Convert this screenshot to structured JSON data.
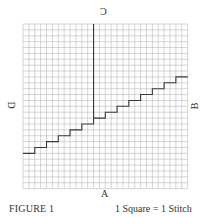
{
  "figure": {
    "caption": "FIGURE 1",
    "scale_note": "1 Square = 1 Stitch",
    "edge_labels": {
      "top": "C",
      "right": "B",
      "bottom": "A",
      "left": "D"
    }
  },
  "grid": {
    "columns": 28,
    "rows": 28,
    "origin_px": [
      23,
      24
    ],
    "cell_px": 5.88,
    "grid_line_color": "#b8b8b8",
    "path_color": "#3a3a3a"
  },
  "chart_data": {
    "type": "diagram",
    "title": "FIGURE 1",
    "subtitle": "1 Square = 1 Stitch",
    "grid_size": [
      28,
      28
    ],
    "edge_labels": {
      "top": "C",
      "right": "B",
      "bottom": "A",
      "left": "D"
    },
    "vertical_line": {
      "column": 12,
      "from_row": 0,
      "to_row": 16
    },
    "staircase": {
      "description": "Step line rising 1 row every 2 columns from left edge (row 22) to right edge (row 9)",
      "start": {
        "column": 0,
        "row": 22
      },
      "end": {
        "column": 28,
        "row": 9
      },
      "step_width_cols": 2,
      "step_height_rows": 1,
      "segments": [
        {
          "cols": [
            0,
            2
          ],
          "row": 22
        },
        {
          "cols": [
            2,
            4
          ],
          "row": 21
        },
        {
          "cols": [
            4,
            6
          ],
          "row": 20
        },
        {
          "cols": [
            6,
            8
          ],
          "row": 19
        },
        {
          "cols": [
            8,
            10
          ],
          "row": 18
        },
        {
          "cols": [
            10,
            12
          ],
          "row": 17
        },
        {
          "cols": [
            12,
            14
          ],
          "row": 16
        },
        {
          "cols": [
            14,
            16
          ],
          "row": 15
        },
        {
          "cols": [
            16,
            18
          ],
          "row": 14
        },
        {
          "cols": [
            18,
            20
          ],
          "row": 13
        },
        {
          "cols": [
            20,
            22
          ],
          "row": 12
        },
        {
          "cols": [
            22,
            24
          ],
          "row": 11
        },
        {
          "cols": [
            24,
            26
          ],
          "row": 10
        },
        {
          "cols": [
            26,
            28
          ],
          "row": 9
        }
      ]
    }
  }
}
